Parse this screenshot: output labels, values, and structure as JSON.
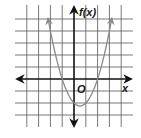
{
  "chart_data": {
    "type": "line",
    "title": "",
    "xlabel": "x",
    "ylabel": "f(x)",
    "origin_label": "O",
    "function": "f(x) = x^2 - x - 2",
    "grid": true,
    "xlim": [
      -5,
      5
    ],
    "ylim": [
      -4,
      6
    ],
    "x_gridlines": [
      -4,
      -3,
      -2,
      -1,
      0,
      1,
      2,
      3,
      4
    ],
    "y_gridlines": [
      -3,
      -2,
      -1,
      0,
      1,
      2,
      3,
      4,
      5
    ],
    "x_intercepts": [
      -1,
      2
    ],
    "y_intercept": -2,
    "vertex": [
      0.5,
      -2.25
    ],
    "series": [
      {
        "name": "f(x)",
        "x": [
          -2.2,
          -2,
          -1.5,
          -1,
          -0.5,
          0,
          0.5,
          1,
          1.5,
          2,
          2.5,
          3,
          3.2
        ],
        "y": [
          5.04,
          4,
          1.75,
          0,
          -1.25,
          -2,
          -2.25,
          -2,
          -1.25,
          0,
          1.75,
          4,
          5.04
        ]
      }
    ],
    "colors": {
      "grid": "#555555",
      "axis": "#111111",
      "curve": "#8a8a8a"
    }
  },
  "labels": {
    "y_axis": "f(x)",
    "x_axis": "x",
    "origin": "O"
  }
}
